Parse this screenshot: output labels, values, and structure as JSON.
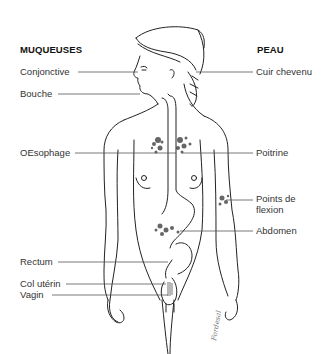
{
  "headers": {
    "left": "MUQUEUSES",
    "right": "PEAU"
  },
  "labels_left": [
    {
      "id": "conjonctive",
      "text": "Conjonctive"
    },
    {
      "id": "bouche",
      "text": "Bouche"
    },
    {
      "id": "oesophage",
      "text": "OEsophage"
    },
    {
      "id": "rectum",
      "text": "Rectum"
    },
    {
      "id": "col-uterin",
      "text": "Col utérin"
    },
    {
      "id": "vagin",
      "text": "Vagin"
    }
  ],
  "labels_right": [
    {
      "id": "cuir-chevelu",
      "text": "Cuir chevenu"
    },
    {
      "id": "poitrine",
      "text": "Poitrine"
    },
    {
      "id": "points-de-flexion",
      "text": "Points de",
      "text2": "flexion"
    },
    {
      "id": "abdomen",
      "text": "Abdomen"
    }
  ],
  "signature": "Fordesal",
  "colors": {
    "line": "#555555",
    "ink": "#222222",
    "background": "#ffffff"
  }
}
